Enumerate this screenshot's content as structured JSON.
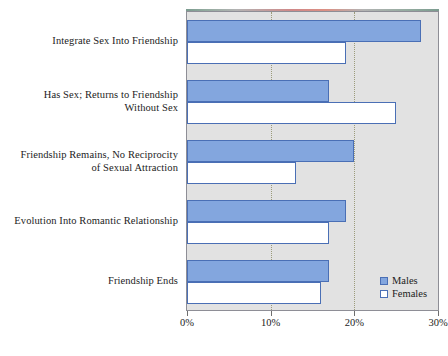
{
  "chart_data": {
    "type": "bar",
    "orientation": "horizontal",
    "title": "",
    "subtitle": "",
    "xlabel": "",
    "ylabel": "",
    "xlim": [
      0,
      30
    ],
    "tick_labels": [
      "0%",
      "10%",
      "20%",
      "30%"
    ],
    "tick_values": [
      0,
      10,
      20,
      30
    ],
    "grid": true,
    "grid_axis": "x",
    "legend_position": "bottom-right",
    "categories": [
      "Integrate Sex Into Friendship",
      "Has Sex; Returns to Friendship Without Sex",
      "Friendship Remains, No Reciprocity of Sexual Attraction",
      "Evolution Into Romantic Relationship",
      "Friendship Ends"
    ],
    "category_label_lines": [
      [
        "Integrate Sex Into Friendship"
      ],
      [
        "Has Sex; Returns to Friendship",
        "Without Sex"
      ],
      [
        "Friendship Remains, No Reciprocity",
        "of Sexual Attraction"
      ],
      [
        "Evolution Into Romantic Relationship"
      ],
      [
        "Friendship Ends"
      ]
    ],
    "series": [
      {
        "name": "Males",
        "color": "#83a6de",
        "border_color": "#4a6fb5",
        "values": [
          28,
          17,
          20,
          19,
          17
        ]
      },
      {
        "name": "Females",
        "color": "#ffffff",
        "border_color": "#4a6fb5",
        "values": [
          19,
          25,
          13,
          17,
          16
        ]
      }
    ],
    "plot_background": "#e2e2e2",
    "gridline_color": "#9b9b7a"
  },
  "legend": {
    "items": [
      {
        "label": "Males",
        "swatch": "males"
      },
      {
        "label": "Females",
        "swatch": "females"
      }
    ]
  }
}
